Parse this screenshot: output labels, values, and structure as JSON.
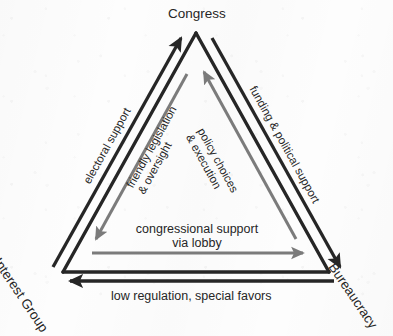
{
  "diagram": {
    "type": "triangle-relationship-diagram",
    "background_color": "#fdfdfd",
    "outer_line_color": "#262626",
    "inner_line_color": "#7b7b7b",
    "text_color": "#262626"
  },
  "vertices": [
    {
      "id": "congress",
      "label": "Congress",
      "position": "top"
    },
    {
      "id": "interest-group",
      "label": "Interest Group",
      "position": "bottom-left"
    },
    {
      "id": "bureaucracy",
      "label": "Bureaucracy",
      "position": "bottom-right"
    }
  ],
  "edges": [
    {
      "id": "electoral-support",
      "label": "electoral support",
      "from": "interest-group",
      "to": "congress",
      "color": "#262626",
      "ring": "outer"
    },
    {
      "id": "funding-political-support",
      "label": "funding & political support",
      "from": "congress",
      "to": "bureaucracy",
      "color": "#262626",
      "ring": "outer"
    },
    {
      "id": "low-regulation-special-favors",
      "label": "low regulation, special favors",
      "from": "bureaucracy",
      "to": "interest-group",
      "color": "#262626",
      "ring": "outer"
    },
    {
      "id": "friendly-legislation-oversight",
      "label_line1": "friendly legislation",
      "label_line2": "& oversight",
      "from": "congress",
      "to": "interest-group",
      "color": "#7b7b7b",
      "ring": "inner"
    },
    {
      "id": "policy-choices-execution",
      "label_line1": "policy choices",
      "label_line2": "& execution",
      "from": "bureaucracy",
      "to": "congress",
      "color": "#7b7b7b",
      "ring": "inner"
    },
    {
      "id": "congressional-support-via-lobby",
      "label_line1": "congressional support",
      "label_line2": "via lobby",
      "from": "interest-group",
      "to": "bureaucracy",
      "color": "#7b7b7b",
      "ring": "inner"
    }
  ]
}
